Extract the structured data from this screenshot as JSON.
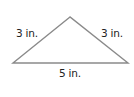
{
  "diagram": {
    "shape": "triangle",
    "type": "isosceles obtuse triangle",
    "vertices": {
      "apex": [
        70,
        17
      ],
      "left": [
        13,
        63
      ],
      "right": [
        128,
        63
      ]
    },
    "line_color": "#8a8a8a",
    "text_color": "#222222",
    "sides": {
      "left": {
        "label": "3 in.",
        "length": 3,
        "unit": "in."
      },
      "right": {
        "label": "3 in.",
        "length": 3,
        "unit": "in."
      },
      "base": {
        "label": "5 in.",
        "length": 5,
        "unit": "in."
      }
    }
  }
}
